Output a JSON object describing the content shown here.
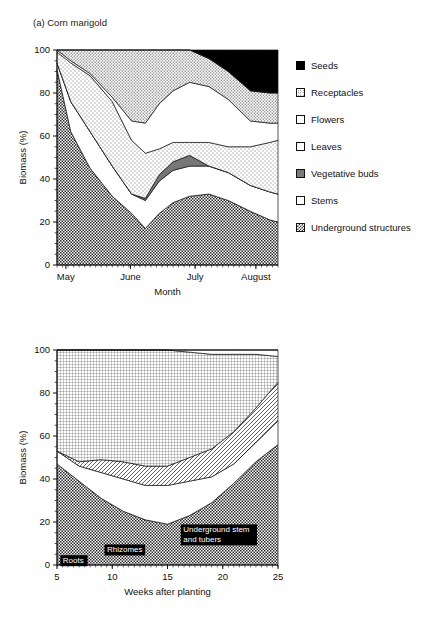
{
  "figure": {
    "panel_a_title": "(a) Corn marigold",
    "panel_b_title": "(b) Jerusalem artichoke"
  },
  "chart_data": [
    {
      "type": "area",
      "title": "(a) Corn marigold",
      "xlabel": "Month",
      "ylabel": "Biomass (%)",
      "ylim": [
        0,
        100
      ],
      "yticks": [
        0,
        20,
        40,
        60,
        80,
        100
      ],
      "ytick_labels": [
        "0",
        "20",
        "40",
        "60",
        "80",
        "100"
      ],
      "xlim": [
        0,
        4
      ],
      "xtick_positions": [
        0.16,
        1.33,
        2.5,
        3.6
      ],
      "xtick_labels": [
        "May",
        "June",
        "July",
        "August"
      ],
      "grid": false,
      "legend_position": "right",
      "stacked": true,
      "stack_order_bottom_to_top": [
        "Underground structures",
        "Stems",
        "Vegetative buds",
        "Leaves",
        "Flowers",
        "Receptacles",
        "Seeds"
      ],
      "x": [
        0,
        0.25,
        0.6,
        1.0,
        1.35,
        1.6,
        1.85,
        2.1,
        2.4,
        2.75,
        3.1,
        3.5,
        3.85,
        4.0
      ],
      "series": [
        {
          "name": "Underground structures",
          "pattern": "checker-dark",
          "values": [
            91,
            62,
            45,
            32,
            24,
            17,
            24,
            29,
            32,
            33,
            30,
            25,
            21,
            20
          ]
        },
        {
          "name": "Stems",
          "pattern": "white",
          "values": [
            3,
            14,
            17,
            14,
            9,
            13,
            15,
            15,
            14,
            13,
            13,
            12,
            13,
            13
          ]
        },
        {
          "name": "Vegetative buds",
          "pattern": "solid-gray",
          "values": [
            0,
            0,
            0,
            0,
            0,
            1,
            3,
            4,
            5,
            0,
            0,
            0,
            0,
            0
          ]
        },
        {
          "name": "Leaves",
          "pattern": "dots-fine",
          "values": [
            5,
            18,
            26,
            30,
            25,
            21,
            12,
            9,
            6,
            11,
            12,
            18,
            23,
            25
          ]
        },
        {
          "name": "Flowers",
          "pattern": "white",
          "values": [
            1,
            1,
            1,
            2,
            9,
            14,
            21,
            24,
            28,
            26,
            22,
            12,
            9,
            8
          ]
        },
        {
          "name": "Receptacles",
          "pattern": "dots-med",
          "values": [
            0,
            5,
            11,
            22,
            33,
            34,
            25,
            19,
            15,
            13,
            13,
            14,
            14,
            14
          ]
        },
        {
          "name": "Seeds",
          "pattern": "solid-black",
          "values": [
            0,
            0,
            0,
            0,
            0,
            0,
            0,
            0,
            0,
            4,
            10,
            19,
            20,
            20
          ]
        }
      ],
      "legend_entries": [
        {
          "label": "Seeds",
          "swatch": "solid-black"
        },
        {
          "label": "Receptacles",
          "swatch": "dots-med"
        },
        {
          "label": "Flowers",
          "swatch": "white"
        },
        {
          "label": "Leaves",
          "swatch": "dots-fine"
        },
        {
          "label": "Vegetative buds",
          "swatch": "solid-gray"
        },
        {
          "label": "Stems",
          "swatch": "white"
        },
        {
          "label": "Underground structures",
          "swatch": "checker-dark"
        }
      ]
    },
    {
      "type": "area",
      "title": "(b) Jerusalem artichoke",
      "xlabel": "Weeks after planting",
      "ylabel": "Biomass (%)",
      "ylim": [
        0,
        100
      ],
      "yticks": [
        0,
        20,
        40,
        60,
        80,
        100
      ],
      "ytick_labels": [
        "0",
        "20",
        "40",
        "60",
        "80",
        "100"
      ],
      "xlim": [
        5,
        25
      ],
      "xticks": [
        5,
        10,
        15,
        20,
        25
      ],
      "xtick_labels": [
        "5",
        "10",
        "15",
        "20",
        "25"
      ],
      "grid": false,
      "legend_position": "right",
      "stacked": true,
      "stack_order_bottom_to_top": [
        "Underground structures",
        "Stem",
        "Branches",
        "Leaves",
        "Flowers",
        "Seeds"
      ],
      "x": [
        5,
        7,
        9,
        11,
        13,
        15,
        17,
        19,
        21,
        23,
        25
      ],
      "series": [
        {
          "name": "Underground structures",
          "pattern": "checker-dark",
          "values": [
            47,
            39,
            31,
            25,
            21,
            19,
            23,
            29,
            38,
            48,
            56
          ]
        },
        {
          "name": "Stem",
          "pattern": "white",
          "values": [
            6,
            7,
            12,
            15,
            16,
            18,
            16,
            12,
            9,
            9,
            11
          ]
        },
        {
          "name": "Branches",
          "pattern": "hatch",
          "values": [
            0,
            2,
            6,
            8,
            9,
            9,
            11,
            13,
            15,
            16,
            18
          ]
        },
        {
          "name": "Leaves",
          "pattern": "grid",
          "values": [
            47,
            52,
            51,
            52,
            54,
            54,
            49,
            44,
            36,
            25,
            12
          ]
        },
        {
          "name": "Flowers",
          "pattern": "white",
          "values": [
            0,
            0,
            0,
            0,
            0,
            0,
            1,
            2,
            2,
            2,
            3
          ]
        },
        {
          "name": "Seeds",
          "pattern": "solid-black",
          "values": [
            0,
            0,
            0,
            0,
            0,
            0,
            0,
            0,
            0,
            0,
            0
          ]
        }
      ],
      "annotations": [
        {
          "text_line1": "Underground stem",
          "text_line2": "and tubers",
          "x": 16.2,
          "y": 14
        },
        {
          "text_line1": "Rhizomes",
          "text_line2": "",
          "x": 9.3,
          "y": 7
        },
        {
          "text_line1": "Roots",
          "text_line2": "",
          "x": 5.3,
          "y": 2
        }
      ],
      "legend_entries": [
        {
          "label": "Seeds",
          "swatch": "solid-black"
        },
        {
          "label": "Flowers",
          "swatch": "white"
        },
        {
          "label": "Leaves",
          "swatch": "grid"
        },
        {
          "label": "Branches",
          "swatch": "hatch"
        },
        {
          "label": "Stem",
          "swatch": "white"
        },
        {
          "label": "Underground structures",
          "swatch": "checker-dark"
        }
      ]
    }
  ]
}
